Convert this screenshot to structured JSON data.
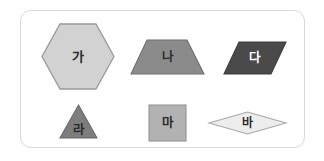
{
  "figure": {
    "type": "geometry-shape-set",
    "background_color": "#ffffff",
    "card": {
      "border_color": "#d9d9d9",
      "fill_color": "#ffffff",
      "corner_radius": "11px"
    },
    "rows": 2,
    "columns": 3
  },
  "shapes": [
    {
      "id": "ga",
      "label": "가",
      "shape": "hexagon",
      "fill": "#d2d2d2",
      "stroke": "#9a9a9a",
      "label_color": "#2b2b2b",
      "row": 1,
      "column": 1
    },
    {
      "id": "na",
      "label": "나",
      "shape": "trapezoid",
      "fill": "#8b8b8b",
      "stroke": "#6f6f6f",
      "label_color": "#2b2b2b",
      "row": 1,
      "column": 2
    },
    {
      "id": "da",
      "label": "다",
      "shape": "parallelogram",
      "fill": "#4a4a4a",
      "stroke": "#3c3c3c",
      "label_color": "#ffffff",
      "row": 1,
      "column": 3
    },
    {
      "id": "ra",
      "label": "라",
      "shape": "triangle",
      "fill": "#7d7d7d",
      "stroke": "#696969",
      "label_color": "#2b2b2b",
      "row": 2,
      "column": 1
    },
    {
      "id": "ma",
      "label": "마",
      "shape": "square",
      "fill": "#b2b2b2",
      "stroke": "#949494",
      "label_color": "#2b2b2b",
      "row": 2,
      "column": 2
    },
    {
      "id": "ba",
      "label": "바",
      "shape": "rhombus",
      "fill": "#ededed",
      "stroke": "#a8a8a8",
      "label_color": "#2b2b2b",
      "row": 2,
      "column": 3
    }
  ]
}
